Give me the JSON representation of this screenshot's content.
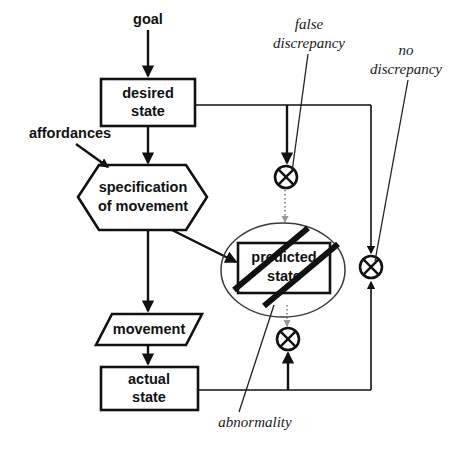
{
  "diagram": {
    "colors": {
      "stroke": "#111111",
      "background": "#ffffff",
      "dotted_link": "#9a9a9a",
      "ellipse_outline": "#3a3a3a"
    },
    "nodes": [
      {
        "id": "desired-state",
        "shape": "rectangle",
        "line1": "desired",
        "line2": "state"
      },
      {
        "id": "specification-of-movement",
        "shape": "hexagon",
        "line1": "specification",
        "line2": "of movement"
      },
      {
        "id": "predicted-state",
        "shape": "rectangle-crossed-out",
        "line1": "predicted",
        "line2": "state"
      },
      {
        "id": "movement",
        "shape": "parallelogram",
        "line1": "movement",
        "line2": ""
      },
      {
        "id": "actual-state",
        "shape": "rectangle",
        "line1": "actual",
        "line2": "state"
      }
    ],
    "annotations": [
      {
        "id": "goal",
        "text": "goal",
        "style": "bold-sans"
      },
      {
        "id": "affordances",
        "text": "affordances",
        "style": "bold-sans"
      },
      {
        "id": "false-discrepancy",
        "line1": "false",
        "line2": "discrepancy",
        "style": "italic-serif"
      },
      {
        "id": "no-discrepancy",
        "line1": "no",
        "line2": "discrepancy",
        "style": "italic-serif"
      },
      {
        "id": "abnormality",
        "line1": "abnormality",
        "line2": "",
        "style": "italic-serif"
      }
    ],
    "comparators": [
      {
        "id": "comparator-top",
        "symbol": "xor"
      },
      {
        "id": "comparator-bottom",
        "symbol": "xor"
      },
      {
        "id": "comparator-right",
        "symbol": "xor"
      }
    ]
  }
}
